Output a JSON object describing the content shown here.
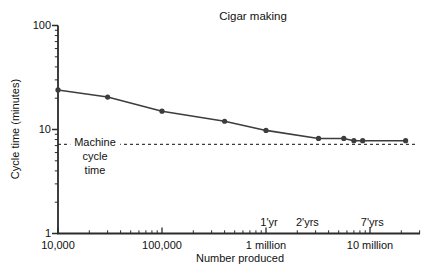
{
  "chart_data": {
    "type": "line",
    "title": "Cigar making",
    "xlabel": "Number produced",
    "ylabel": "Cycle time (minutes)",
    "x_scale": "log",
    "y_scale": "log",
    "x_range": [
      10000,
      30000000
    ],
    "y_range": [
      1,
      100
    ],
    "grid": false,
    "legend": "none",
    "x_ticks": [
      {
        "value": 10000,
        "label": "10,000"
      },
      {
        "value": 100000,
        "label": "100,000"
      },
      {
        "value": 1000000,
        "label": "1 million"
      },
      {
        "value": 10000000,
        "label": "10 million"
      }
    ],
    "y_ticks": [
      {
        "value": 1,
        "label": "1"
      },
      {
        "value": 10,
        "label": "10"
      },
      {
        "value": 100,
        "label": "100"
      }
    ],
    "series": [
      {
        "name": "cycle time vs number produced",
        "marker": "circle",
        "points": [
          [
            10000,
            24
          ],
          [
            30000,
            20.5
          ],
          [
            100000,
            15
          ],
          [
            400000,
            12
          ],
          [
            1000000,
            9.8
          ],
          [
            3200000,
            8.2
          ],
          [
            5600000,
            8.2
          ],
          [
            7000000,
            7.8
          ],
          [
            8500000,
            7.8
          ],
          [
            22000000,
            7.8
          ]
        ]
      }
    ],
    "reference_line": {
      "value": 7.2,
      "style": "dashed",
      "label_lines": [
        "Machine",
        "cycle",
        "time"
      ]
    },
    "annotations": [
      {
        "label": "1'yr",
        "x": 1070000
      },
      {
        "label": "2'yrs",
        "x": 2500000
      },
      {
        "label": "7'yrs",
        "x": 10500000
      }
    ],
    "colors": {
      "line": "#3d3d3d",
      "axis": "#2b2b2b",
      "text": "#111111",
      "background": "#ffffff"
    }
  }
}
